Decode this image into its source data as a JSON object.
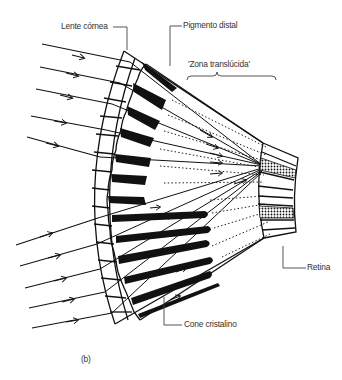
{
  "figure": {
    "panel_label": "(b)",
    "labels": {
      "cornea_lens": "Lente córnea",
      "distal_pigment": "Pigmento distal",
      "clear_zone": "'Zona translúcida'",
      "retina": "Retina",
      "crystalline_cone": "Cone cristalino"
    },
    "colors": {
      "ink": "#111111",
      "text": "#333333",
      "leader": "#444444",
      "background": "#ffffff"
    }
  }
}
